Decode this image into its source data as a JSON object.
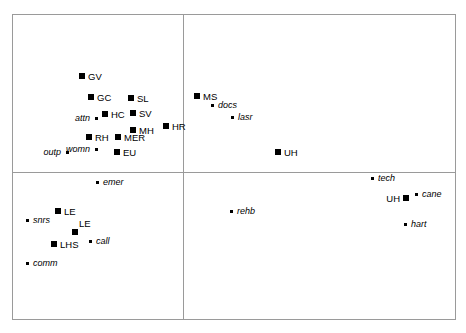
{
  "chart_data": {
    "type": "scatter",
    "title": "",
    "subtitle": "",
    "xlabel": "",
    "ylabel": "",
    "grid": false,
    "legend": "none",
    "axis_lines": {
      "vertical_divider_x": 183,
      "horizontal_divider_y": 172
    },
    "frame": {
      "left": 12,
      "top": 14,
      "right": 456,
      "bottom": 320
    },
    "marker_types": [
      {
        "name": "square",
        "shape": "filled-square",
        "color": "#000000",
        "label_style": "upright-uppercase"
      },
      {
        "name": "dot",
        "shape": "filled-dot",
        "color": "#000000",
        "label_style": "italic-lowercase"
      }
    ],
    "series": [
      {
        "name": "square",
        "points": [
          {
            "label": "GV",
            "x": 82,
            "y": 76,
            "anchor": "right"
          },
          {
            "label": "GC",
            "x": 91,
            "y": 97,
            "anchor": "right"
          },
          {
            "label": "SL",
            "x": 131,
            "y": 98,
            "anchor": "right"
          },
          {
            "label": "HC",
            "x": 105,
            "y": 114,
            "anchor": "right"
          },
          {
            "label": "SV",
            "x": 133,
            "y": 113,
            "anchor": "right"
          },
          {
            "label": "MH",
            "x": 133,
            "y": 130,
            "anchor": "right"
          },
          {
            "label": "HR",
            "x": 166,
            "y": 126,
            "anchor": "right"
          },
          {
            "label": "RH",
            "x": 89,
            "y": 137,
            "anchor": "right"
          },
          {
            "label": "MER",
            "x": 118,
            "y": 137,
            "anchor": "right"
          },
          {
            "label": "EU",
            "x": 117,
            "y": 152,
            "anchor": "right"
          },
          {
            "label": "MS",
            "x": 197,
            "y": 96,
            "anchor": "right"
          },
          {
            "label": "UH",
            "x": 278,
            "y": 152,
            "anchor": "right"
          },
          {
            "label": "LE",
            "x": 58,
            "y": 211,
            "anchor": "right"
          },
          {
            "label": "LE",
            "x": 75,
            "y": 232,
            "anchor": "above"
          },
          {
            "label": "LHS",
            "x": 54,
            "y": 244,
            "anchor": "right"
          },
          {
            "label": "UH",
            "x": 406,
            "y": 198,
            "anchor": "left"
          }
        ]
      },
      {
        "name": "dot",
        "points": [
          {
            "label": "attn",
            "x": 96,
            "y": 118,
            "anchor": "left"
          },
          {
            "label": "outp",
            "x": 67,
            "y": 152,
            "anchor": "left"
          },
          {
            "label": "womn",
            "x": 96,
            "y": 149,
            "anchor": "left"
          },
          {
            "label": "docs",
            "x": 212,
            "y": 105,
            "anchor": "right"
          },
          {
            "label": "lasr",
            "x": 232,
            "y": 117,
            "anchor": "right"
          },
          {
            "label": "emer",
            "x": 97,
            "y": 182,
            "anchor": "right"
          },
          {
            "label": "snrs",
            "x": 27,
            "y": 220,
            "anchor": "right"
          },
          {
            "label": "call",
            "x": 90,
            "y": 241,
            "anchor": "right"
          },
          {
            "label": "comm",
            "x": 27,
            "y": 263,
            "anchor": "right"
          },
          {
            "label": "tech",
            "x": 372,
            "y": 178,
            "anchor": "right"
          },
          {
            "label": "cane",
            "x": 416,
            "y": 194,
            "anchor": "right"
          },
          {
            "label": "rehb",
            "x": 231,
            "y": 211,
            "anchor": "right"
          },
          {
            "label": "hart",
            "x": 405,
            "y": 224,
            "anchor": "right"
          }
        ]
      }
    ]
  },
  "colors": {
    "marker": "#000000",
    "frame": "#9a9a9a",
    "background": "#ffffff"
  }
}
